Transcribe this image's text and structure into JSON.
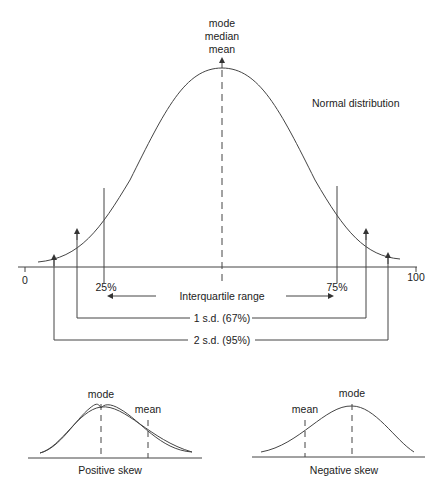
{
  "main_diagram": {
    "title": "Normal distribution",
    "peak_labels": [
      "mode",
      "median",
      "mean"
    ],
    "axis": {
      "min_label": "0",
      "max_label": "100"
    },
    "quartiles": {
      "q1_label": "25%",
      "q3_label": "75%"
    },
    "ranges": {
      "interquartile": "Interquartile range",
      "one_sd": "1 s.d. (67%)",
      "two_sd": "2 s.d. (95%)"
    }
  },
  "positive_skew": {
    "caption": "Positive skew",
    "mode_label": "mode",
    "mean_label": "mean"
  },
  "negative_skew": {
    "caption": "Negative skew",
    "mode_label": "mode",
    "mean_label": "mean"
  },
  "colors": {
    "line": "#444444",
    "text": "#222222",
    "background": "#ffffff"
  }
}
